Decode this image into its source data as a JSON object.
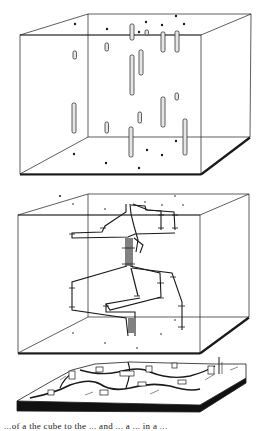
{
  "figure": {
    "panels": [
      {
        "id": "cube-boreholes",
        "description": "Transparent block with isolated vertical well segments and surface dots"
      },
      {
        "id": "cube-network",
        "description": "Transparent block with connected branching network of segments"
      },
      {
        "id": "terrain-block",
        "description": "Block diagram of surface landscape with buildings"
      }
    ],
    "caption": "...of a the cube to the ... and ... a ... in a ..."
  },
  "colors": {
    "line": "#1a1a1a",
    "background": "#ffffff",
    "tube_fill": "#e6e6e6"
  }
}
